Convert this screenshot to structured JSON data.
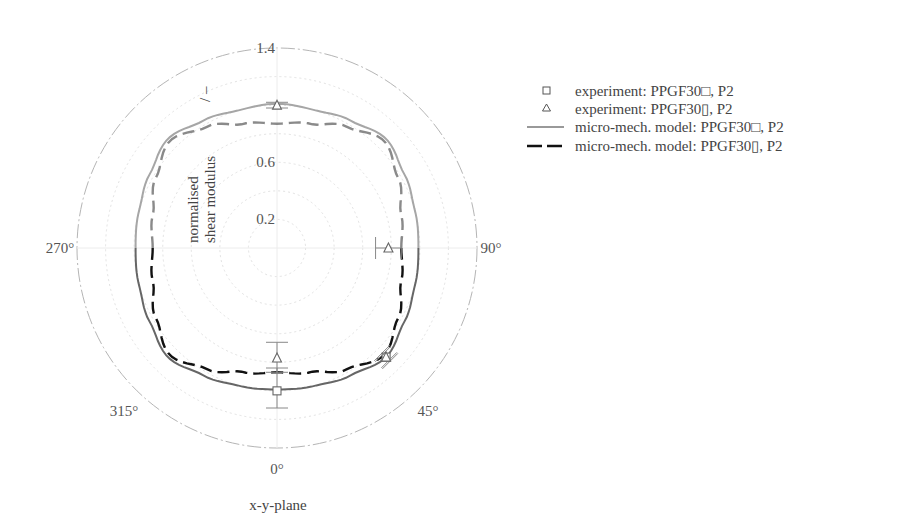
{
  "chart_data": {
    "type": "polar-line",
    "title": "",
    "plane_label": "x-y-plane",
    "radial_axis": {
      "label_line1": "normalised",
      "label_line2": "shear modulus",
      "unit": "/ –",
      "range": [
        0,
        1.4
      ],
      "ticks": [
        0.2,
        0.6,
        1.0,
        1.4
      ],
      "tick_labels": [
        "0.2",
        "0.6",
        "",
        "1.4"
      ],
      "grid_rings": [
        0.2,
        0.4,
        0.6,
        0.8,
        1.0,
        1.2,
        1.4
      ]
    },
    "angular_axis": {
      "zero_direction": "bottom",
      "direction": "counterclockwise-on-screen (90° at right)",
      "labels": [
        {
          "angle": 0,
          "text": "0°"
        },
        {
          "angle": 45,
          "text": "45°"
        },
        {
          "angle": 90,
          "text": "90°"
        },
        {
          "angle": 270,
          "text": "270°"
        },
        {
          "angle": 315,
          "text": "315°"
        }
      ]
    },
    "series": [
      {
        "name": "experiment: PPGF30□, P2",
        "kind": "marker",
        "marker": "square",
        "points": [
          {
            "angle": 0,
            "value": 1.0,
            "err_low": 0.84,
            "err_high": 1.12
          },
          {
            "angle": 45,
            "value": 1.08,
            "err_low": 1.04,
            "err_high": 1.12
          }
        ]
      },
      {
        "name": "experiment: PPGF30▯, P2",
        "kind": "marker",
        "marker": "triangle",
        "points": [
          {
            "angle": 0,
            "value": 0.77,
            "err_low": 0.66,
            "err_high": 0.87
          },
          {
            "angle": 45,
            "value": 1.08,
            "err_low": 1.05,
            "err_high": 1.11
          },
          {
            "angle": 90,
            "value": 0.78,
            "err_low": 0.69,
            "err_high": 0.87
          },
          {
            "angle": 180,
            "value": 1.0,
            "err_low": 0.98,
            "err_high": 1.02
          }
        ]
      },
      {
        "name": "micro-mech. model: PPGF30□, P2",
        "kind": "line",
        "style": "solid",
        "color": "#666666",
        "angles": [
          0,
          15,
          30,
          45,
          60,
          75,
          90,
          105,
          120,
          135,
          150,
          165,
          180
        ],
        "values": [
          0.99,
          1.0,
          1.03,
          1.08,
          1.03,
          1.0,
          0.99,
          1.0,
          1.03,
          1.08,
          1.03,
          1.0,
          1.01
        ]
      },
      {
        "name": "micro-mech. model: PPGF30▯, P2",
        "kind": "line",
        "style": "dashed",
        "color": "#111111",
        "angles": [
          0,
          15,
          30,
          45,
          60,
          75,
          90,
          105,
          120,
          135,
          150,
          165,
          180
        ],
        "values": [
          0.87,
          0.9,
          0.98,
          1.06,
          0.98,
          0.9,
          0.87,
          0.9,
          0.98,
          1.06,
          0.98,
          0.9,
          0.87
        ]
      }
    ],
    "legend": {
      "position": "right",
      "entries": [
        {
          "symbol": "square",
          "label": "experiment: PPGF30□, P2"
        },
        {
          "symbol": "triangle",
          "label": "experiment: PPGF30▯, P2"
        },
        {
          "symbol": "solid-line",
          "label": "micro-mech. model: PPGF30□, P2"
        },
        {
          "symbol": "dashed-line",
          "label": "micro-mech. model: PPGF30▯, P2"
        }
      ]
    }
  }
}
